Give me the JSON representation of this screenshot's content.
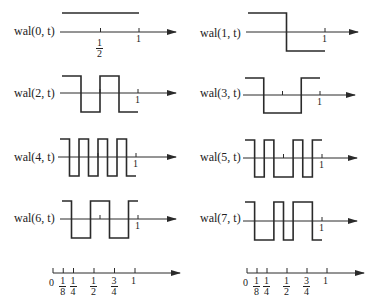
{
  "diagram": {
    "type": "walsh-functions",
    "line_color": "#2a2a2a",
    "panels": [
      {
        "label": "wal(0, t)",
        "index": 0,
        "transitions": [],
        "start": 1
      },
      {
        "label": "wal(1, t)",
        "index": 1,
        "transitions": [
          0.5
        ],
        "start": 1
      },
      {
        "label": "wal(2, t)",
        "index": 2,
        "transitions": [
          0.25,
          0.5,
          0.75
        ],
        "start": 1
      },
      {
        "label": "wal(3, t)",
        "index": 3,
        "transitions": [
          0.25,
          0.75
        ],
        "start": 1
      },
      {
        "label": "wal(4, t)",
        "index": 4,
        "transitions": [
          0.125,
          0.25,
          0.375,
          0.5,
          0.625,
          0.75,
          0.875
        ],
        "start": 1
      },
      {
        "label": "wal(5, t)",
        "index": 5,
        "transitions": [
          0.125,
          0.25,
          0.375,
          0.625,
          0.75,
          0.875
        ],
        "start": 1
      },
      {
        "label": "wal(6, t)",
        "index": 6,
        "transitions": [
          0.125,
          0.375,
          0.625,
          0.875
        ],
        "start": 1
      },
      {
        "label": "wal(7, t)",
        "index": 7,
        "transitions": [
          0.125,
          0.375,
          0.5,
          0.625,
          0.875
        ],
        "start": 1
      }
    ],
    "axis_tick_labels": {
      "one": "1",
      "half_num": "1",
      "half_den": "2"
    },
    "ruler": {
      "zero": "0",
      "ticks": [
        {
          "value": 0.125,
          "num": "1",
          "den": "8"
        },
        {
          "value": 0.25,
          "num": "1",
          "den": "4"
        },
        {
          "value": 0.5,
          "num": "1",
          "den": "2"
        },
        {
          "value": 0.75,
          "num": "3",
          "den": "4"
        },
        {
          "value": 1,
          "num": "1",
          "den": ""
        }
      ]
    }
  }
}
